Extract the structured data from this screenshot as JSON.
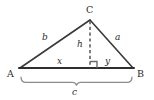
{
  "diagram": {
    "kind": "geometry-triangle-with-altitude",
    "canvas": {
      "width": 154,
      "height": 100,
      "background": "#ffffff"
    },
    "colors": {
      "base_line": "#2e2e2e",
      "side_line": "#3a3a3a",
      "dashed_line": "#555555",
      "brace": "#8c8c8c",
      "right_angle": "#6a6a6a",
      "text": "#2b2b2b"
    },
    "vertices": [
      {
        "id": "A",
        "label": "A",
        "x": 20,
        "y": 68,
        "label_x": 7,
        "label_y": 70
      },
      {
        "id": "B",
        "label": "B",
        "x": 133,
        "y": 68,
        "label_x": 137,
        "label_y": 70
      },
      {
        "id": "C",
        "label": "C",
        "x": 90,
        "y": 20,
        "label_x": 86,
        "label_y": 5
      }
    ],
    "foot": {
      "id": "H",
      "x": 90,
      "y": 68
    },
    "sides": [
      {
        "id": "a",
        "label": "a",
        "from": "C",
        "to": "B",
        "label_x": 115,
        "label_y": 34
      },
      {
        "id": "b",
        "label": "b",
        "from": "A",
        "to": "C",
        "label_x": 42,
        "label_y": 34
      },
      {
        "id": "c",
        "label": "c",
        "from": "A",
        "to": "B",
        "label_x": 72,
        "label_y": 88
      }
    ],
    "segments": [
      {
        "id": "h",
        "label": "h",
        "description": "altitude from C to AB",
        "style": "dashed",
        "label_x": 77,
        "label_y": 40
      },
      {
        "id": "x",
        "label": "x",
        "description": "base segment A to foot",
        "label_x": 57,
        "label_y": 57
      },
      {
        "id": "y",
        "label": "y",
        "description": "base segment foot to B",
        "label_x": 105,
        "label_y": 57
      }
    ],
    "markers": [
      {
        "id": "right-angle",
        "name": "right-angle-marker",
        "x": 90,
        "y": 68,
        "size": 7
      }
    ],
    "brace": {
      "id": "base-brace",
      "from_x": 20,
      "to_x": 133,
      "y": 76,
      "depth": 7
    }
  }
}
